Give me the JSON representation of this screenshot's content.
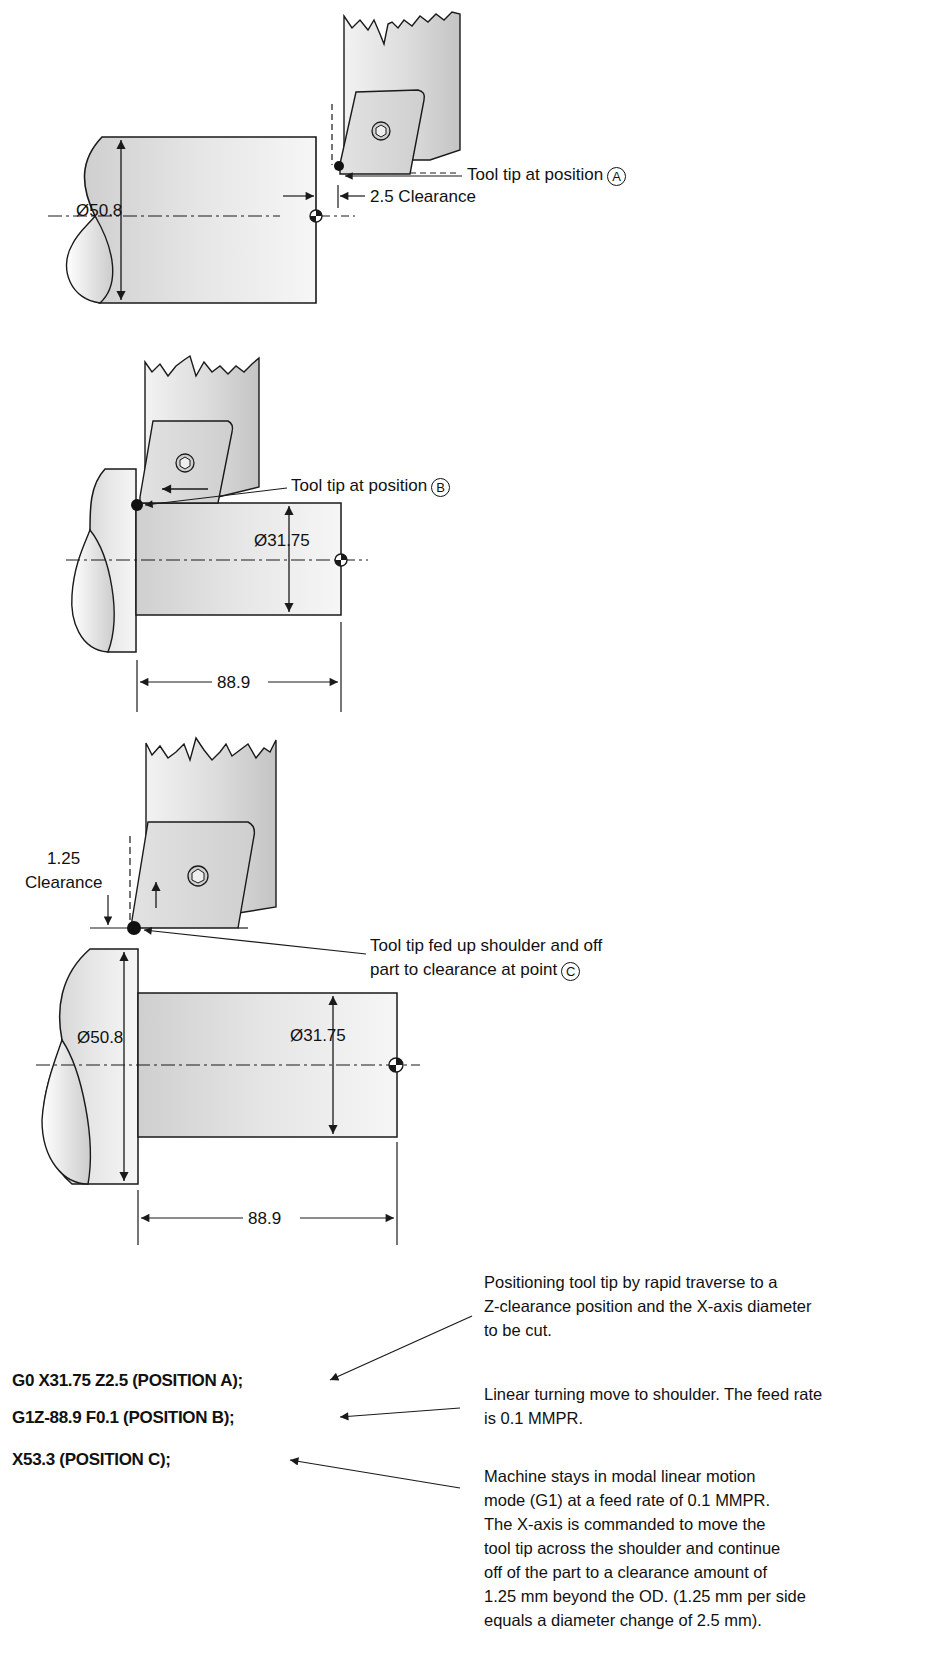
{
  "figure_1": {
    "diameter_label": "Ø50.8",
    "tool_callout": "Tool tip at position",
    "tool_callout_marker": "A",
    "clearance_label": "2.5 Clearance"
  },
  "figure_2": {
    "diameter_label": "Ø31.75",
    "tool_callout": "Tool tip at position",
    "tool_callout_marker": "B",
    "length_label": "88.9"
  },
  "figure_3": {
    "clearance_value": "1.25",
    "clearance_word": "Clearance",
    "callout_line1": "Tool tip fed up shoulder and off",
    "callout_line2": "part to clearance at point",
    "callout_marker": "C",
    "large_diameter_label": "Ø50.8",
    "small_diameter_label": "Ø31.75",
    "length_label": "88.9"
  },
  "program": {
    "lines": [
      "G0 X31.75 Z2.5 (POSITION A);",
      "G1Z-88.9 F0.1 (POSITION B);",
      "X53.3 (POSITION C);"
    ],
    "descriptions": [
      [
        "Positioning tool tip by rapid traverse to a",
        "Z-clearance position and the X-axis diameter",
        "to be cut."
      ],
      [
        "Linear turning move to shoulder.  The feed rate",
        "is 0.1 MMPR."
      ],
      [
        "Machine stays in modal linear motion",
        "mode (G1) at a feed rate of 0.1 MMPR.",
        "The X-axis is commanded to move the",
        "tool tip across the shoulder and continue",
        "off of the part to a clearance amount of",
        "1.25 mm beyond the OD. (1.25 mm per side",
        "equals a diameter change of 2.5 mm)."
      ]
    ]
  },
  "colors": {
    "line": "#1a1a1a",
    "part_fill": "#e4e4e4",
    "tool_fill": "#d8d8d8"
  }
}
